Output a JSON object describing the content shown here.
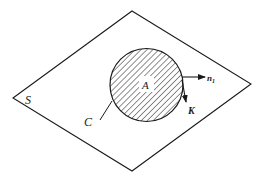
{
  "diagram": {
    "type": "geometric-figure",
    "colors": {
      "stroke": "#1a1a1a",
      "background": "#ffffff",
      "hatch": "#333333"
    },
    "plane": {
      "label": "S",
      "vertices": [
        [
          132,
          11
        ],
        [
          251,
          84
        ],
        [
          132,
          171
        ],
        [
          13,
          98
        ]
      ]
    },
    "region": {
      "label": "A",
      "center": [
        146.5,
        85
      ],
      "radius": 36.5,
      "fill": "diagonal-hatch"
    },
    "boundary": {
      "label": "C",
      "leader_from": [
        100,
        120
      ],
      "leader_to": [
        112,
        101
      ]
    },
    "vectors": [
      {
        "name": "normal",
        "label": "n",
        "subscript": "1",
        "from": [
          182,
          77
        ],
        "to": [
          205,
          77
        ]
      },
      {
        "name": "k-vector",
        "label": "K",
        "from": [
          182,
          80
        ],
        "to": [
          186,
          102
        ]
      }
    ]
  }
}
